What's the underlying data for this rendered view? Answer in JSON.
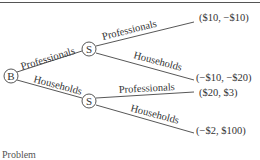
{
  "figure": {
    "top_rule_text": "",
    "bottom_caption_fragment": "Problem"
  },
  "tree": {
    "root": {
      "label": "B"
    },
    "level1": [
      {
        "edge_label": "Professionals",
        "node_label": "S"
      },
      {
        "edge_label": "Households",
        "node_label": "S"
      }
    ],
    "terminals": [
      {
        "edge_label": "Professionals",
        "payoff": "($10, −$10)"
      },
      {
        "edge_label": "Households",
        "payoff": "(−$10, −$20)"
      },
      {
        "edge_label": "Professionals",
        "payoff": "($20, $3)"
      },
      {
        "edge_label": "Households",
        "payoff": "(−$2, $100)"
      }
    ]
  }
}
